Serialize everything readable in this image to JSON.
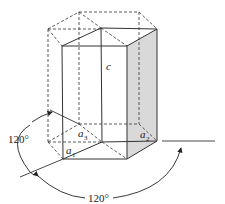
{
  "diagram": {
    "labels": {
      "c": "c",
      "a1": "a",
      "a1_sub": "1",
      "a2": "a",
      "a2_sub": "2",
      "a3": "a",
      "a3_sub": "3",
      "angle_left": "120°",
      "angle_bottom": "120°"
    },
    "colors": {
      "line": "#333333",
      "shade": "#d9d9d9",
      "background": "#ffffff"
    }
  }
}
